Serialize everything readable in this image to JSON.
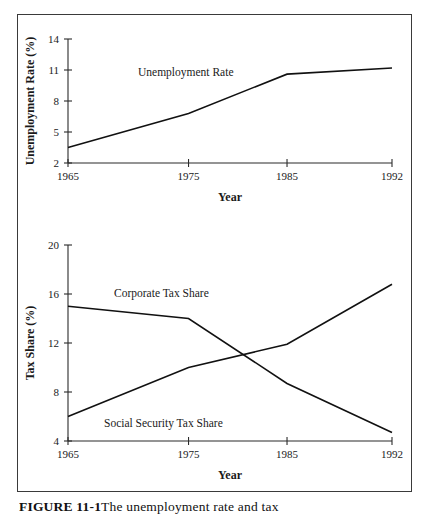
{
  "figure": {
    "caption_label": "FIGURE 11-1",
    "caption_text": "The unemployment rate and tax",
    "frame_color": "#3a3a3a"
  },
  "chart_data": [
    {
      "id": "unemployment",
      "type": "line",
      "title": "",
      "xlabel": "Year",
      "ylabel": "Unemployment Rate (%)",
      "x": [
        1965,
        1975,
        1985,
        1992
      ],
      "xtick_labels": [
        "1965",
        "1975",
        "1985",
        "1992"
      ],
      "ytick_labels": [
        "2",
        "5",
        "8",
        "11",
        "14"
      ],
      "yticks": [
        2,
        5,
        8,
        11,
        14
      ],
      "ylim": [
        2,
        14
      ],
      "xlim": [
        1965,
        1992
      ],
      "grid": false,
      "legend": "inline-label",
      "series": [
        {
          "name": "Unemployment Rate",
          "label": "Unemployment Rate",
          "values": [
            3.5,
            6.8,
            10.6,
            11.2
          ],
          "color": "#111111"
        }
      ]
    },
    {
      "id": "tax-share",
      "type": "line",
      "title": "",
      "xlabel": "Year",
      "ylabel": "Tax Share (%)",
      "x": [
        1965,
        1975,
        1985,
        1992
      ],
      "xtick_labels": [
        "1965",
        "1975",
        "1985",
        "1992"
      ],
      "ytick_labels": [
        "4",
        "8",
        "12",
        "16",
        "20"
      ],
      "yticks": [
        4,
        8,
        12,
        16,
        20
      ],
      "ylim": [
        4,
        20
      ],
      "xlim": [
        1965,
        1992
      ],
      "grid": false,
      "legend": "inline-label",
      "series": [
        {
          "name": "Corporate Tax Share",
          "label": "Corporate Tax Share",
          "values": [
            15.0,
            14.0,
            8.7,
            4.7
          ],
          "color": "#111111"
        },
        {
          "name": "Social Security Tax Share",
          "label": "Social Security Tax Share",
          "values": [
            6.0,
            10.0,
            11.9,
            16.8
          ],
          "color": "#111111"
        }
      ]
    }
  ]
}
